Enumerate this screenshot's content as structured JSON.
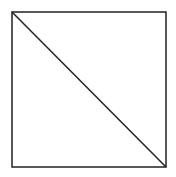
{
  "diagram": {
    "background": "#ffffff",
    "stroke_color": "#222222",
    "stroke_width": 1.5,
    "square": {
      "x": 12,
      "y": 12,
      "width": 154,
      "height": 155
    },
    "diagonal": {
      "x1": 12,
      "y1": 12,
      "x2": 166,
      "y2": 167
    }
  }
}
